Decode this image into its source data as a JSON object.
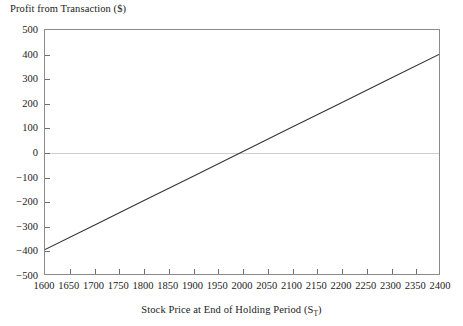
{
  "chart_data": {
    "type": "line",
    "title": "",
    "ylabel": "Profit from Transaction ($)",
    "xlabel_prefix": "Stock Price at End of Holding Period (S",
    "xlabel_sub": "T",
    "xlabel_suffix": ")",
    "xlabel_plain": "Stock Price at End of Holding Period (S_T)",
    "xlim": [
      1600,
      2400
    ],
    "ylim": [
      -500,
      500
    ],
    "grid": false,
    "legend": "none",
    "zero_line": true,
    "zero_line_color": "#cfcfcf",
    "line_color": "#33333a",
    "frame_color": "#8a8a8a",
    "xticks": [
      1600,
      1650,
      1700,
      1750,
      1800,
      1850,
      1900,
      1950,
      2000,
      2050,
      2100,
      2150,
      2200,
      2250,
      2300,
      2350,
      2400
    ],
    "xtick_labels": [
      "1600",
      "1650",
      "1700",
      "1750",
      "1800",
      "1850",
      "1900",
      "1950",
      "2000",
      "2050",
      "2100",
      "2150",
      "2200",
      "2250",
      "2300",
      "2350",
      "2400"
    ],
    "yticks": [
      -500,
      -400,
      -300,
      -200,
      -100,
      0,
      100,
      200,
      300,
      400,
      500
    ],
    "ytick_labels": [
      "−500",
      "−400",
      "−300",
      "−200",
      "−100",
      "0",
      "100",
      "200",
      "300",
      "400",
      "500"
    ],
    "series": [
      {
        "name": "Profit",
        "x": [
          1600,
          2400
        ],
        "values": [
          -400,
          400
        ],
        "points": [
          {
            "x": 1600,
            "y": -400
          },
          {
            "x": 1700,
            "y": -300
          },
          {
            "x": 1800,
            "y": -200
          },
          {
            "x": 1900,
            "y": -100
          },
          {
            "x": 2000,
            "y": 0
          },
          {
            "x": 2100,
            "y": 100
          },
          {
            "x": 2200,
            "y": 200
          },
          {
            "x": 2300,
            "y": 300
          },
          {
            "x": 2400,
            "y": 400
          }
        ],
        "breakeven": 2000,
        "slope": 1
      }
    ]
  }
}
